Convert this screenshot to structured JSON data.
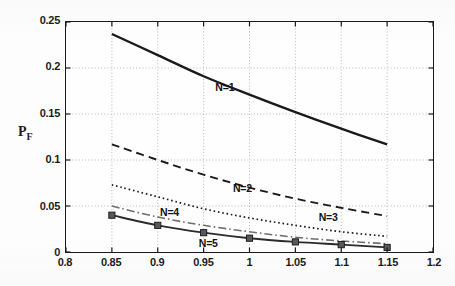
{
  "chart_data": {
    "type": "line",
    "title": "",
    "xlabel": "L",
    "ylabel": "P_F",
    "ylabel_base": "P",
    "ylabel_sub": "F",
    "xlim": [
      0.8,
      1.2
    ],
    "ylim": [
      0,
      0.25
    ],
    "grid": true,
    "legend_position": "inline-annotations",
    "xticks": [
      "0.8",
      "0.85",
      "0.9",
      "0.95",
      "1",
      "1.05",
      "1.1",
      "1.15",
      "1.2"
    ],
    "xtick_values": [
      0.8,
      0.85,
      0.9,
      0.95,
      1.0,
      1.05,
      1.1,
      1.15,
      1.2
    ],
    "yticks": [
      "0",
      "0.05",
      "0.1",
      "0.15",
      "0.2",
      "0.25"
    ],
    "ytick_values": [
      0,
      0.05,
      0.1,
      0.15,
      0.2,
      0.25
    ],
    "x": [
      0.85,
      0.9,
      0.95,
      1.0,
      1.05,
      1.1,
      1.15
    ],
    "series": [
      {
        "name": "N=1",
        "label": "N=1",
        "style": "solid",
        "color": "#1a1a1a",
        "width": 2.4,
        "marker": "none",
        "values": [
          0.237,
          0.214,
          0.191,
          0.171,
          0.152,
          0.134,
          0.117
        ],
        "label_x": 0.963,
        "label_y": 0.178
      },
      {
        "name": "N=2",
        "label": "N=2",
        "style": "dashed",
        "color": "#1a1a1a",
        "width": 1.9,
        "marker": "none",
        "values": [
          0.117,
          0.1,
          0.084,
          0.07,
          0.058,
          0.048,
          0.039
        ],
        "label_x": 0.982,
        "label_y": 0.0685
      },
      {
        "name": "N=3",
        "label": "N=3",
        "style": "dotted",
        "color": "#1a1a1a",
        "width": 1.7,
        "marker": "none",
        "values": [
          0.073,
          0.06,
          0.047,
          0.037,
          0.029,
          0.022,
          0.017
        ],
        "label_x": 1.075,
        "label_y": 0.0375
      },
      {
        "name": "N=4",
        "label": "N=4",
        "style": "dashdot",
        "color": "#6e6e6e",
        "width": 1.6,
        "marker": "none",
        "values": [
          0.05,
          0.038,
          0.029,
          0.022,
          0.016,
          0.012,
          0.009
        ],
        "label_x": 0.903,
        "label_y": 0.0435
      },
      {
        "name": "N=5",
        "label": "N=5",
        "style": "solid",
        "color": "#2b2b2b",
        "width": 1.9,
        "marker": "square",
        "values": [
          0.04,
          0.029,
          0.021,
          0.015,
          0.011,
          0.008,
          0.005
        ],
        "label_x": 0.945,
        "label_y": 0.0095
      }
    ]
  }
}
